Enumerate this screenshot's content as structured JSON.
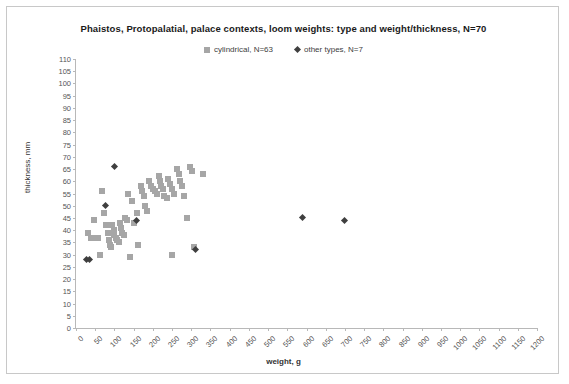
{
  "chart_data": {
    "type": "scatter",
    "title": "Phaistos,  Protopalatial, palace contexts, loom weights: type and weight/thickness, N=70",
    "xlabel": "weight, g",
    "ylabel": "thickness, mm",
    "xlim": [
      0,
      1200
    ],
    "ylim": [
      0,
      110
    ],
    "xtick_step": 50,
    "ytick_step": 5,
    "xticks": [
      0,
      50,
      100,
      150,
      200,
      250,
      300,
      350,
      400,
      450,
      500,
      550,
      600,
      650,
      700,
      750,
      800,
      850,
      900,
      950,
      1000,
      1050,
      1100,
      1150,
      1200
    ],
    "yticks": [
      0,
      5,
      10,
      15,
      20,
      25,
      30,
      35,
      40,
      45,
      50,
      55,
      60,
      65,
      70,
      75,
      80,
      85,
      90,
      95,
      100,
      105,
      110
    ],
    "grid": false,
    "legend_position": "top-center",
    "colors": {
      "cylindrical": "#a6a6a6",
      "other_types": "#3f3f3f"
    },
    "series": [
      {
        "name": "cylindrical, N=63",
        "marker": "square",
        "color": "#a6a6a6",
        "points": [
          [
            30,
            39
          ],
          [
            40,
            37
          ],
          [
            48,
            44
          ],
          [
            52,
            37
          ],
          [
            55,
            37
          ],
          [
            58,
            37
          ],
          [
            62,
            30
          ],
          [
            68,
            56
          ],
          [
            72,
            47
          ],
          [
            78,
            42
          ],
          [
            82,
            39
          ],
          [
            85,
            36
          ],
          [
            88,
            34
          ],
          [
            92,
            33
          ],
          [
            95,
            42
          ],
          [
            98,
            40
          ],
          [
            100,
            38
          ],
          [
            104,
            37
          ],
          [
            108,
            36
          ],
          [
            112,
            35
          ],
          [
            115,
            43
          ],
          [
            118,
            41
          ],
          [
            120,
            39
          ],
          [
            124,
            38
          ],
          [
            128,
            45
          ],
          [
            132,
            44
          ],
          [
            136,
            55
          ],
          [
            140,
            29
          ],
          [
            146,
            52
          ],
          [
            150,
            43
          ],
          [
            158,
            47
          ],
          [
            162,
            34
          ],
          [
            168,
            58
          ],
          [
            172,
            56
          ],
          [
            176,
            54
          ],
          [
            180,
            50
          ],
          [
            184,
            48
          ],
          [
            190,
            60
          ],
          [
            196,
            58
          ],
          [
            200,
            57
          ],
          [
            205,
            56
          ],
          [
            210,
            55
          ],
          [
            215,
            62
          ],
          [
            218,
            60
          ],
          [
            222,
            58
          ],
          [
            226,
            57
          ],
          [
            230,
            54
          ],
          [
            236,
            53
          ],
          [
            240,
            61
          ],
          [
            245,
            59
          ],
          [
            250,
            57
          ],
          [
            256,
            55
          ],
          [
            262,
            65
          ],
          [
            268,
            63
          ],
          [
            272,
            60
          ],
          [
            276,
            58
          ],
          [
            280,
            54
          ],
          [
            288,
            45
          ],
          [
            296,
            66
          ],
          [
            302,
            64
          ],
          [
            308,
            33
          ],
          [
            330,
            63
          ],
          [
            250,
            30
          ]
        ]
      },
      {
        "name": "other types, N=7",
        "marker": "diamond",
        "color": "#3f3f3f",
        "points": [
          [
            28,
            28
          ],
          [
            34,
            28
          ],
          [
            78,
            50
          ],
          [
            100,
            66
          ],
          [
            158,
            44
          ],
          [
            310,
            32
          ],
          [
            590,
            45
          ],
          [
            700,
            44
          ]
        ]
      }
    ]
  },
  "legend": {
    "entries": [
      {
        "label": "cylindrical, N=63",
        "marker": "square"
      },
      {
        "label": "other types, N=7",
        "marker": "diamond"
      }
    ]
  }
}
